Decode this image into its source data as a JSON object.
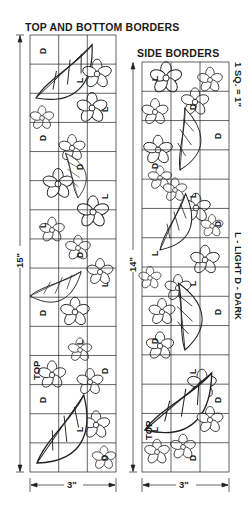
{
  "titles": {
    "top_bottom": "TOP AND BOTTOM BORDERS",
    "side": "SIDE BORDERS"
  },
  "scale_note": "1 SQ. = 1\"",
  "legend": "L - LIGHT   D - DARK",
  "panels": {
    "top_bottom": {
      "height_label": "15\"",
      "width_label": "3\"",
      "columns": 3,
      "rows": 15,
      "top_label": "TOP",
      "markers": [
        "D",
        "L",
        "L",
        "D",
        "D",
        "L",
        "L",
        "D",
        "L",
        "D",
        "L",
        "D",
        "D",
        "L",
        "D"
      ]
    },
    "side": {
      "height_label": "14\"",
      "width_label": "3\"",
      "columns": 3,
      "rows": 14,
      "top_label": "TOP",
      "markers": [
        "L",
        "D",
        "D",
        "D",
        "L",
        "D",
        "L",
        "L",
        "D",
        "D",
        "L",
        "D",
        "L",
        "D"
      ]
    }
  }
}
